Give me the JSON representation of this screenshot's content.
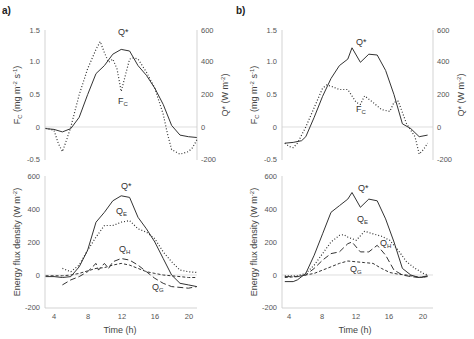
{
  "chart_data": [
    {
      "panel": "a)",
      "position": "top-left",
      "type": "line",
      "xlabel": "",
      "ylabel_left": "F_C (mg m-2 s-1)",
      "ylabel_right": "Q* (W m-2)",
      "ylim_left": [
        -0.5,
        1.5
      ],
      "ylim_right": [
        -200,
        600
      ],
      "yticks_left": [
        "1.5",
        "1.0",
        "0.5",
        "0",
        "-0.5"
      ],
      "yticks_right": [
        "600",
        "400",
        "200",
        "0",
        "-200"
      ],
      "series": [
        {
          "name": "Q*",
          "axis": "right",
          "style": "solid",
          "x": [
            3,
            4,
            5,
            6,
            7,
            8,
            9,
            10,
            11,
            12,
            13,
            14,
            15,
            16,
            17,
            18,
            19,
            20,
            21
          ],
          "values": [
            -10,
            -15,
            -30,
            -10,
            60,
            200,
            330,
            380,
            450,
            480,
            470,
            380,
            320,
            240,
            140,
            10,
            -50,
            -60,
            -65
          ]
        },
        {
          "name": "F_C",
          "axis": "left",
          "style": "dotted",
          "x": [
            3,
            4,
            4.5,
            5,
            5.5,
            6,
            7,
            8,
            9,
            9.5,
            10,
            10.5,
            11,
            11.5,
            12,
            12.5,
            13,
            13.5,
            14,
            15,
            16,
            17,
            17.5,
            18,
            19,
            20,
            20.5,
            21
          ],
          "values": [
            -0.02,
            -0.05,
            -0.25,
            -0.38,
            -0.2,
            0.0,
            0.5,
            0.9,
            1.2,
            1.32,
            1.15,
            1.0,
            1.05,
            0.9,
            0.55,
            0.8,
            1.05,
            1.07,
            1.05,
            0.85,
            0.6,
            0.2,
            -0.1,
            -0.35,
            -0.42,
            -0.38,
            -0.32,
            -0.2
          ]
        }
      ],
      "annotations": [
        "Q*",
        "F_C"
      ]
    },
    {
      "panel": "a)",
      "position": "bottom-left",
      "type": "line",
      "xlabel": "Time (h)",
      "ylabel": "Energy flux density (W m-2)",
      "xticks": [
        "4",
        "8",
        "12",
        "16",
        "20"
      ],
      "ylim": [
        -200,
        600
      ],
      "yticks": [
        "600",
        "400",
        "200",
        "0",
        "-200"
      ],
      "series": [
        {
          "name": "Q*",
          "style": "solid",
          "x": [
            3,
            4,
            5,
            6,
            7,
            8,
            9,
            10,
            11,
            12,
            13,
            14,
            15,
            16,
            17,
            18,
            19,
            20,
            21
          ],
          "values": [
            -10,
            -10,
            -15,
            -10,
            50,
            150,
            320,
            380,
            450,
            480,
            470,
            350,
            280,
            200,
            100,
            0,
            -50,
            -60,
            -70
          ]
        },
        {
          "name": "Q_E",
          "style": "dotted",
          "x": [
            5,
            6,
            7,
            8,
            9,
            10,
            11,
            12,
            13,
            14,
            15,
            16,
            17,
            18,
            19,
            20,
            21
          ],
          "values": [
            40,
            20,
            60,
            150,
            230,
            300,
            300,
            320,
            330,
            280,
            260,
            220,
            140,
            80,
            30,
            20,
            15
          ]
        },
        {
          "name": "Q_H",
          "style": "long-dash",
          "x": [
            5,
            6,
            7,
            8,
            9,
            9.3,
            10,
            10.5,
            11,
            12,
            13,
            14,
            15,
            16,
            17,
            18,
            19,
            20,
            21
          ],
          "values": [
            -60,
            -30,
            -10,
            20,
            70,
            30,
            70,
            40,
            80,
            100,
            90,
            60,
            20,
            -20,
            -50,
            -70,
            -75,
            -80,
            -70
          ]
        },
        {
          "name": "Q_G",
          "style": "short-dash",
          "x": [
            3,
            4,
            5,
            6,
            7,
            8,
            9,
            10,
            11,
            12,
            13,
            14,
            15,
            16,
            17,
            18,
            19,
            20,
            21
          ],
          "values": [
            -5,
            -5,
            -5,
            0,
            10,
            25,
            40,
            45,
            60,
            70,
            60,
            40,
            20,
            10,
            0,
            -5,
            -10,
            -15,
            -15
          ]
        }
      ],
      "annotations": [
        "Q*",
        "Q_E",
        "Q_H",
        "Q_G"
      ]
    },
    {
      "panel": "b)",
      "position": "top-right",
      "type": "line",
      "ylabel_left": "F_C (mg m-2 s-1)",
      "ylabel_right": "Q* (W m-2)",
      "ylim_left": [
        -0.5,
        1.5
      ],
      "ylim_right": [
        -200,
        600
      ],
      "yticks_left": [
        "1.5",
        "1.0",
        "0.5",
        "0",
        "-0.5"
      ],
      "yticks_right": [
        "600",
        "400",
        "200",
        "0",
        "-200"
      ],
      "series": [
        {
          "name": "Q*",
          "axis": "right",
          "style": "solid",
          "x": [
            3.5,
            4.5,
            5.5,
            6,
            7,
            8,
            9,
            10,
            11,
            11.5,
            12.5,
            13.5,
            14.5,
            15.5,
            16.5,
            17.5,
            18.5,
            19.5,
            20.5
          ],
          "values": [
            -100,
            -95,
            -85,
            -60,
            60,
            190,
            300,
            380,
            420,
            490,
            400,
            450,
            445,
            350,
            200,
            20,
            -10,
            -60,
            -50
          ]
        },
        {
          "name": "F_C",
          "axis": "left",
          "style": "dotted",
          "x": [
            3.5,
            4,
            4.5,
            5,
            6,
            7,
            8,
            8.5,
            9,
            10,
            11,
            12,
            12.5,
            13,
            14,
            15,
            16,
            16.5,
            17,
            18,
            19,
            19.5,
            20,
            20.5
          ],
          "values": [
            -0.25,
            -0.3,
            -0.32,
            -0.25,
            0.0,
            0.3,
            0.6,
            0.65,
            0.63,
            0.58,
            0.58,
            0.38,
            0.35,
            0.48,
            0.38,
            0.27,
            0.24,
            0.38,
            0.4,
            0.05,
            -0.15,
            -0.42,
            -0.35,
            -0.25
          ]
        }
      ],
      "annotations": [
        "Q*",
        "F_C"
      ]
    },
    {
      "panel": "b)",
      "position": "bottom-right",
      "type": "line",
      "xlabel": "Time (h)",
      "ylabel": "Energy flux density (W m-2)",
      "xticks": [
        "4",
        "8",
        "12",
        "16",
        "20"
      ],
      "ylim": [
        -200,
        600
      ],
      "yticks": [
        "600",
        "400",
        "200",
        "0",
        "-200"
      ],
      "series": [
        {
          "name": "Q*",
          "style": "solid",
          "x": [
            3.5,
            4.5,
            5,
            6,
            7,
            8,
            9,
            10,
            11,
            11.5,
            12.5,
            13.5,
            14.5,
            15.5,
            16.5,
            17.5,
            18.5,
            19.5,
            20.5
          ],
          "values": [
            -40,
            -40,
            -30,
            10,
            120,
            250,
            380,
            420,
            460,
            500,
            410,
            460,
            450,
            340,
            200,
            40,
            0,
            -15,
            -10
          ]
        },
        {
          "name": "Q_E",
          "style": "dotted",
          "x": [
            3.5,
            5,
            6,
            7,
            8,
            9,
            10,
            10.5,
            11,
            12,
            13,
            14,
            15,
            16,
            17,
            18,
            19,
            20,
            20.5
          ],
          "values": [
            -5,
            -5,
            10,
            60,
            130,
            200,
            240,
            245,
            230,
            210,
            265,
            250,
            235,
            210,
            150,
            80,
            40,
            10,
            0
          ]
        },
        {
          "name": "Q_H",
          "style": "long-dash",
          "x": [
            3.5,
            5,
            6,
            7,
            8,
            9,
            10,
            11,
            11.5,
            12.5,
            13.5,
            14.5,
            15.5,
            16.5,
            17.5,
            18.5,
            19.5,
            20.5
          ],
          "values": [
            -10,
            -10,
            0,
            40,
            90,
            130,
            140,
            190,
            200,
            140,
            140,
            180,
            120,
            30,
            0,
            -10,
            -15,
            -5
          ]
        },
        {
          "name": "Q_G",
          "style": "short-dash",
          "x": [
            3.5,
            5,
            6,
            7,
            8,
            9,
            10,
            11,
            12,
            13,
            14,
            15,
            16,
            17,
            18,
            19,
            20,
            20.5
          ],
          "values": [
            -15,
            -10,
            0,
            10,
            30,
            50,
            70,
            85,
            80,
            75,
            70,
            40,
            15,
            5,
            0,
            -10,
            -15,
            -5
          ]
        }
      ],
      "annotations": [
        "Q*",
        "Q_E",
        "Q_H",
        "Q_G"
      ]
    }
  ],
  "labels": {
    "panel_a": "a)",
    "panel_b": "b)",
    "fc_main": "F",
    "fc_sub": "C",
    "fc_units": " (mg m",
    "fc_units_sup1": "-2",
    "fc_units_mid": " s",
    "fc_units_sup2": "-1",
    "fc_units_end": ")",
    "qstar_axis": "Q* (W m",
    "qstar_axis_sup": "-2",
    "qstar_axis_end": ")",
    "energy_axis": "Energy flux density (W m",
    "energy_axis_sup": "-2",
    "energy_axis_end": ")",
    "time_axis": "Time (h)",
    "q_main": "Q",
    "qstar_label": "Q*",
    "sub_e": "E",
    "sub_h": "H",
    "sub_g": "G"
  },
  "colors": {
    "axis": "#c8c8c8",
    "zero_line": "#d0d0d0",
    "curve": "#333333",
    "text": "#555555"
  }
}
